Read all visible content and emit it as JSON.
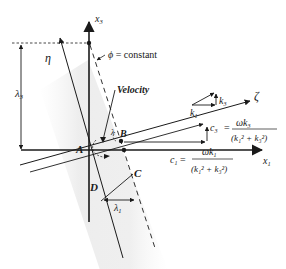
{
  "figure": {
    "type": "wave-propagation-diagram",
    "axes": {
      "x1_label": "x",
      "x1_sub": "1",
      "x3_label": "x",
      "x3_sub": "3"
    },
    "rotated_axes": {
      "eta_label": "η",
      "zeta_label": "ζ"
    },
    "wavefront_label": {
      "phi": "ϕ",
      "eq": " = constant"
    },
    "velocity_label": "Velocity",
    "points": {
      "A": "A",
      "B": "B",
      "C": "C",
      "D": "D"
    },
    "wavelengths": {
      "lambda": "λ",
      "lambda3_sub": "3",
      "lambda1_sub": "1",
      "lambda_short": "λ"
    },
    "wavenumber_vectors": {
      "k": "k",
      "k1_sub": "1",
      "k3_sub": "3"
    },
    "phase_speeds": {
      "c3": {
        "symbol": "c",
        "sub": "3",
        "eq": "=",
        "numerator_omega": "ω",
        "numerator_k": "k",
        "numerator_sub": "3",
        "denominator": "(k₁² + k₃²)"
      },
      "c1": {
        "symbol": "c",
        "sub": "1",
        "eq": "=",
        "numerator_omega": "ω",
        "numerator_k": "k",
        "numerator_sub": "1",
        "denominator": "(k₁² + k₃²)"
      }
    },
    "colors": {
      "line": "#1a1a1a",
      "band": "#ececec",
      "background": "#ffffff"
    }
  }
}
